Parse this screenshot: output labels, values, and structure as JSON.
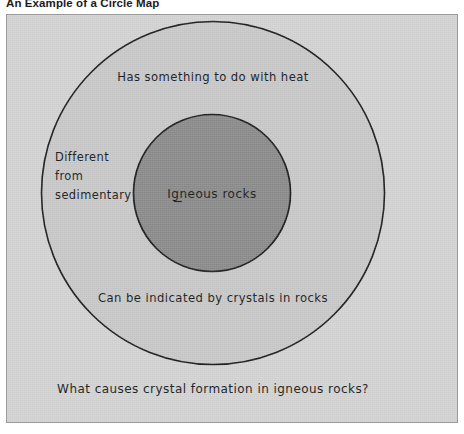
{
  "caption": "An Example of a Circle Map",
  "diagram": {
    "type": "circle-map",
    "center_label": "Igneous rocks",
    "ring_labels": [
      {
        "id": "top",
        "text": "Has something to do with heat"
      },
      {
        "id": "left",
        "lines": [
          "Different",
          "from",
          "sedimentary"
        ]
      },
      {
        "id": "bottom",
        "text": "Can be indicated by crystals in rocks"
      }
    ],
    "ring_label_left_line1": "Different",
    "ring_label_left_line2": "from",
    "ring_label_left_line3": "sedimentary",
    "ring_label_top": "Has something to do with heat",
    "ring_label_bottom": "Can be indicated by crystals in rocks",
    "frame_question": "What causes crystal formation in igneous rocks?",
    "colors": {
      "panel_background": "#d3d3d3",
      "outer_circle_fill": "#c8c8c8",
      "inner_circle_fill": "#8a8a8a",
      "stroke": "#1b1b1b",
      "panel_border": "#9a9a9a",
      "text": "#17191c"
    },
    "geometry": {
      "outer_circle_center_x": 206,
      "outer_circle_center_y": 178,
      "outer_circle_radius": 172,
      "inner_circle_center_x": 205,
      "inner_circle_center_y": 178,
      "inner_circle_radius": 79
    }
  }
}
